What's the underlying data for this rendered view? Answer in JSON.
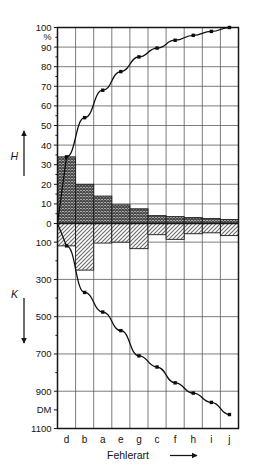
{
  "chart_data": {
    "type": "bar",
    "title": "",
    "subtitle": "",
    "xlabel": "Fehlerart",
    "categories": [
      "d",
      "b",
      "a",
      "e",
      "g",
      "c",
      "f",
      "h",
      "i",
      "j"
    ],
    "grid": true,
    "legend_position": "none",
    "axes": {
      "top": {
        "name": "H",
        "unit": "%",
        "direction": "up",
        "range": [
          0,
          100
        ],
        "ticks": [
          0,
          10,
          20,
          30,
          40,
          50,
          60,
          70,
          80,
          90,
          100
        ],
        "tick_labels": [
          "0",
          "10",
          "20",
          "30",
          "40",
          "50",
          "60",
          "70",
          "80",
          "90",
          "100"
        ],
        "minor_ticks": [
          5,
          15,
          25,
          35,
          45,
          55,
          65,
          75,
          85,
          95
        ]
      },
      "bottom": {
        "name": "K",
        "unit": "DM",
        "direction": "down",
        "range": [
          0,
          1100
        ],
        "ticks": [
          100,
          300,
          500,
          700,
          900,
          1100
        ],
        "tick_labels": [
          "100",
          "300",
          "500",
          "700",
          "900",
          "1100"
        ],
        "unit_tick_label": "DM",
        "unit_tick_value": 1000,
        "minor_ticks": [
          200,
          400,
          600,
          800
        ]
      }
    },
    "series": [
      {
        "name": "H",
        "role": "frequency-bars",
        "axis": "top",
        "unit": "%",
        "values": [
          34,
          20,
          14,
          9.5,
          7.5,
          4,
          3.5,
          3,
          2.5,
          2
        ]
      },
      {
        "name": "K",
        "role": "cost-bars",
        "axis": "bottom",
        "unit": "DM",
        "values": [
          120,
          250,
          105,
          100,
          135,
          60,
          85,
          55,
          50,
          65
        ]
      },
      {
        "name": "H-cumulative",
        "role": "pareto-curve",
        "axis": "top",
        "unit": "%",
        "values": [
          34,
          54,
          68,
          77.5,
          85,
          89.5,
          93.5,
          96,
          98,
          100
        ]
      },
      {
        "name": "K-cumulative",
        "role": "cost-curve",
        "axis": "bottom",
        "unit": "DM",
        "values": [
          120,
          370,
          475,
          575,
          710,
          770,
          855,
          910,
          960,
          1025
        ]
      }
    ],
    "colors": {
      "frame": "#161616",
      "grid": "#5b5b5b",
      "curve": "#0d0d0d",
      "bar_top_fill": "#8d8d8d",
      "bar_bottom_fill": "#b9b9b9",
      "background": "#ffffff"
    }
  },
  "labels": {
    "top_axis_name": "H",
    "bottom_axis_name": "K",
    "percent_unit": "%",
    "dm_unit": "DM",
    "x_title": "Fehlerart"
  },
  "icons": {
    "up_arrow": "arrow-up-icon",
    "down_arrow": "arrow-down-icon",
    "right_arrow": "arrow-right-icon"
  }
}
